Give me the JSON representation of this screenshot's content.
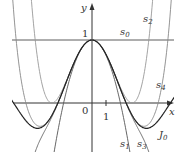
{
  "diagram": {
    "axes": {
      "x_label": "x",
      "y_label": "y",
      "origin_label": "0",
      "x_tick_label": "1",
      "y_tick_label": "1"
    },
    "curves": [
      {
        "name": "s",
        "sub": "0",
        "color": "#444444"
      },
      {
        "name": "s",
        "sub": "1",
        "color": "#555555"
      },
      {
        "name": "s",
        "sub": "2",
        "color": "#999999"
      },
      {
        "name": "s",
        "sub": "3",
        "color": "#666666"
      },
      {
        "name": "s",
        "sub": "4",
        "color": "#888888"
      },
      {
        "name": "J",
        "sub": "0",
        "color": "#222222"
      }
    ]
  }
}
